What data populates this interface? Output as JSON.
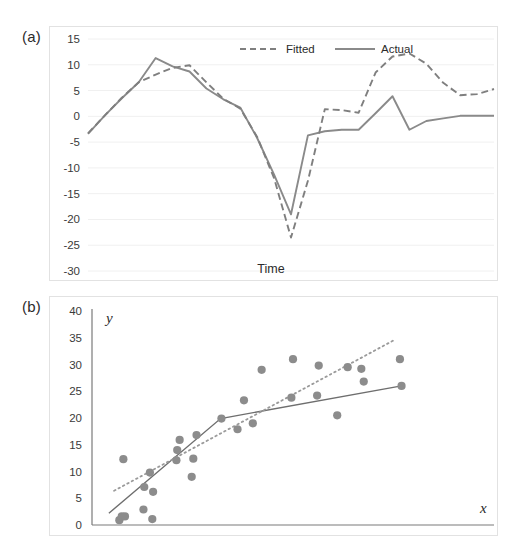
{
  "figure": {
    "panels": [
      {
        "id": "a",
        "label": "(a)"
      },
      {
        "id": "b",
        "label": "(b)"
      }
    ]
  },
  "chart_data": [
    {
      "type": "line",
      "panel": "(a)",
      "title": "",
      "xlabel": "Time",
      "ylabel": "",
      "ylim": [
        -30,
        15
      ],
      "xlim": [
        0,
        25
      ],
      "yticks": [
        "15",
        "10",
        "5",
        "0",
        "-5",
        "-10",
        "-15",
        "-20",
        "-25",
        "-30"
      ],
      "ytick_values": [
        15,
        10,
        5,
        0,
        -5,
        -10,
        -15,
        -20,
        -25,
        -30
      ],
      "xticks": [],
      "grid": true,
      "legend_position": "top-center",
      "colors": {
        "fitted": "#7f7f7f",
        "actual": "#8a8a8a",
        "grid": "#f0f0f0",
        "text": "#2b2b2b"
      },
      "x": [
        0,
        1,
        2,
        3,
        4,
        5,
        6,
        7,
        8,
        9,
        10,
        11,
        12,
        13,
        14,
        15,
        16,
        17,
        18,
        19,
        20,
        21,
        22,
        23,
        24,
        25
      ],
      "series": [
        {
          "name": "Fitted",
          "style": "dashed",
          "values": [
            -3.3,
            0.2,
            3.6,
            6.6,
            8.1,
            9.4,
            9.9,
            6.6,
            3.4,
            1.5,
            -4.0,
            -12.0,
            -23.5,
            -12.5,
            1.4,
            1.2,
            0.7,
            8.5,
            11.6,
            12.2,
            10.2,
            6.5,
            4.1,
            4.3,
            5.3
          ]
        },
        {
          "name": "Actual",
          "style": "solid",
          "values": [
            -3.4,
            0.2,
            3.5,
            6.6,
            11.3,
            9.7,
            8.7,
            5.4,
            3.3,
            1.7,
            -4.2,
            -11.3,
            -19.0,
            -3.7,
            -2.9,
            -2.6,
            -2.6,
            0.6,
            3.9,
            -2.6,
            -0.9,
            -0.4,
            0.1,
            0.1,
            0.1
          ]
        }
      ]
    },
    {
      "type": "scatter",
      "panel": "(b)",
      "title": "",
      "xlabel": "x",
      "ylabel": "y",
      "ylim": [
        0,
        40
      ],
      "xlim": [
        0,
        10
      ],
      "yticks": [
        "40",
        "35",
        "30",
        "25",
        "20",
        "15",
        "10",
        "5",
        "0"
      ],
      "ytick_values": [
        40,
        35,
        30,
        25,
        20,
        15,
        10,
        5,
        0
      ],
      "xticks": [],
      "grid": false,
      "colors": {
        "marker": "#8c8c8c",
        "solid_fit": "#6e6e6e",
        "dotted_fit": "#9a9a9a",
        "axis": "#7a7a7a"
      },
      "points": [
        {
          "x": 0.68,
          "y": 0.9
        },
        {
          "x": 0.74,
          "y": 1.6
        },
        {
          "x": 0.82,
          "y": 1.6
        },
        {
          "x": 0.78,
          "y": 12.3
        },
        {
          "x": 1.28,
          "y": 2.9
        },
        {
          "x": 1.3,
          "y": 7.1
        },
        {
          "x": 1.44,
          "y": 9.8
        },
        {
          "x": 1.5,
          "y": 1.1
        },
        {
          "x": 1.52,
          "y": 6.2
        },
        {
          "x": 2.1,
          "y": 12.1
        },
        {
          "x": 2.12,
          "y": 14.0
        },
        {
          "x": 2.18,
          "y": 15.9
        },
        {
          "x": 2.48,
          "y": 9.0
        },
        {
          "x": 2.52,
          "y": 12.4
        },
        {
          "x": 2.6,
          "y": 16.8
        },
        {
          "x": 3.22,
          "y": 19.9
        },
        {
          "x": 3.62,
          "y": 17.9
        },
        {
          "x": 3.78,
          "y": 23.3
        },
        {
          "x": 4.0,
          "y": 19.0
        },
        {
          "x": 4.22,
          "y": 29.0
        },
        {
          "x": 5.0,
          "y": 31.0
        },
        {
          "x": 4.96,
          "y": 23.8
        },
        {
          "x": 5.6,
          "y": 24.2
        },
        {
          "x": 5.64,
          "y": 29.8
        },
        {
          "x": 6.1,
          "y": 20.5
        },
        {
          "x": 6.36,
          "y": 29.5
        },
        {
          "x": 6.7,
          "y": 29.2
        },
        {
          "x": 6.76,
          "y": 26.8
        },
        {
          "x": 7.66,
          "y": 31.0
        },
        {
          "x": 7.7,
          "y": 26.0
        }
      ],
      "fit_lines": [
        {
          "name": "logarithmic-fit",
          "style": "solid",
          "x_start": 0.42,
          "y_start": 2.2,
          "x_mid": 3.2,
          "y_mid": 19.9,
          "x_end": 7.7,
          "y_end": 26.0
        },
        {
          "name": "linear-fit",
          "style": "dotted",
          "x_start": 0.55,
          "y_start": 6.4,
          "x_end": 7.55,
          "y_end": 34.7
        }
      ]
    }
  ]
}
